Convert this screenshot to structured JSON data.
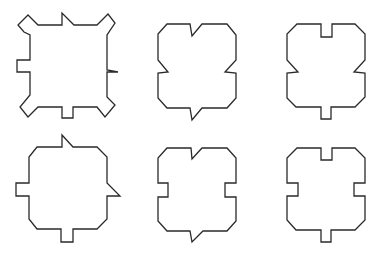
{
  "figure": {
    "width": 381,
    "height": 254,
    "background": "#ffffff",
    "stroke_color": "#2a2a2a",
    "layout": "2 rows x 3 columns of polygonal outline shapes",
    "shapes": [
      {
        "id": "shape-1",
        "row": 1,
        "col": 1,
        "description": "square with chamfered notched corners, small triangular spike on top edge, rectangular tab on left edge, triangular flick on right edge, rectangular tab on bottom edge",
        "points": "28,15 38,25 62,25 62,13 74,25 97,25 108,14 115,23 107,35 107,70 118,72 107,72 107,97 115,105 105,117 97,107 73,107 73,118 62,118 62,107 38,107 28,117 20,107 30,95 30,72 17,72 17,60 30,60 30,35 24,32 18,25"
      },
      {
        "id": "shape-2",
        "row": 1,
        "col": 2,
        "description": "chamfered square with V notch on top, triangular notches on left and right, downward spike on bottom",
        "points": "167,24 190,24 192,36 202,24 227,24 236,35 236,60 225,72 236,73 236,98 227,108 202,108 192,120 190,108 167,108 158,98 158,73 168,72 158,60 158,34"
      },
      {
        "id": "shape-3",
        "row": 1,
        "col": 3,
        "description": "chamfered square with rectangular notch on top, triangular notches on left and right, rectangular tab on bottom",
        "points": "297,24 321,24 321,37 332,37 332,24 355,24 365,34 365,60 354,72 365,73 365,97 355,107 331,107 331,119 321,119 321,107 296,107 287,98 287,73 298,72 287,60 287,34"
      },
      {
        "id": "shape-4",
        "row": 2,
        "col": 1,
        "description": "chamfered square with spike on top, rectangular tab on left, triangular flick on right, rectangular tab on bottom",
        "points": "37,147 62,147 62,135 73,147 97,147 107,157 107,183 120,196 107,196 107,219 97,229 73,229 73,242 61,242 61,229 37,229 29,219 29,196 16,196 16,183 29,183 29,157"
      },
      {
        "id": "shape-5",
        "row": 2,
        "col": 2,
        "description": "chamfered square with V notch on top, rectangular notches on left and right, downward spike on bottom",
        "points": "167,148 191,148 192,159 202,148 227,148 236,158 236,183 225,183 225,197 236,197 236,221 227,231 203,231 192,242 190,231 167,231 158,221 158,197 168,197 168,183 158,183 158,158"
      },
      {
        "id": "shape-6",
        "row": 2,
        "col": 3,
        "description": "chamfered square with rectangular notch on top, rectangular notches on left and right, rectangular tab on bottom",
        "points": "297,148 321,148 321,160 332,160 332,148 355,148 365,158 365,183 354,183 354,196 365,196 365,220 355,230 331,230 331,242 321,242 321,230 296,230 287,220 287,196 298,196 298,183 287,183 287,158"
      }
    ]
  }
}
